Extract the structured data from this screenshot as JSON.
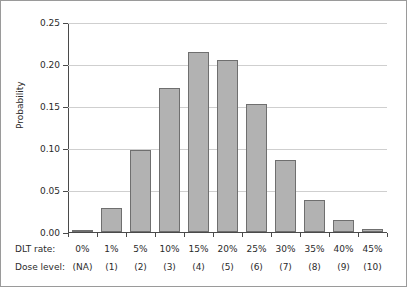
{
  "chart_data": {
    "type": "bar",
    "title": "",
    "xlabel": "",
    "ylabel": "Probability",
    "ylim": [
      0,
      0.25
    ],
    "yticks": [
      "0.00",
      "0.05",
      "0.10",
      "0.15",
      "0.20",
      "0.25"
    ],
    "ytick_values": [
      0.0,
      0.05,
      0.1,
      0.15,
      0.2,
      0.25
    ],
    "grid": true,
    "legend": null,
    "categories": [
      "0%",
      "1%",
      "5%",
      "10%",
      "15%",
      "20%",
      "25%",
      "30%",
      "35%",
      "40%",
      "45%"
    ],
    "values": [
      0.001,
      0.029,
      0.098,
      0.172,
      0.214,
      0.205,
      0.152,
      0.086,
      0.038,
      0.014,
      0.003
    ],
    "row_labels": {
      "dlt_rate": "DLT rate:",
      "dose_level": "Dose level:"
    },
    "dlt_rate": [
      "0%",
      "1%",
      "5%",
      "10%",
      "15%",
      "20%",
      "25%",
      "30%",
      "35%",
      "40%",
      "45%"
    ],
    "dose_level": [
      "(NA)",
      "(1)",
      "(2)",
      "(3)",
      "(4)",
      "(5)",
      "(6)",
      "(7)",
      "(8)",
      "(9)",
      "(10)"
    ],
    "colors": {
      "bar_fill": "#b2b2b2",
      "bar_stroke": "#6f6f6f",
      "gridline": "#cfcfcf",
      "axis": "#4a4a4a",
      "text": "#2b2b2b",
      "frame": "#9a9a9a",
      "background": "#ffffff"
    }
  }
}
